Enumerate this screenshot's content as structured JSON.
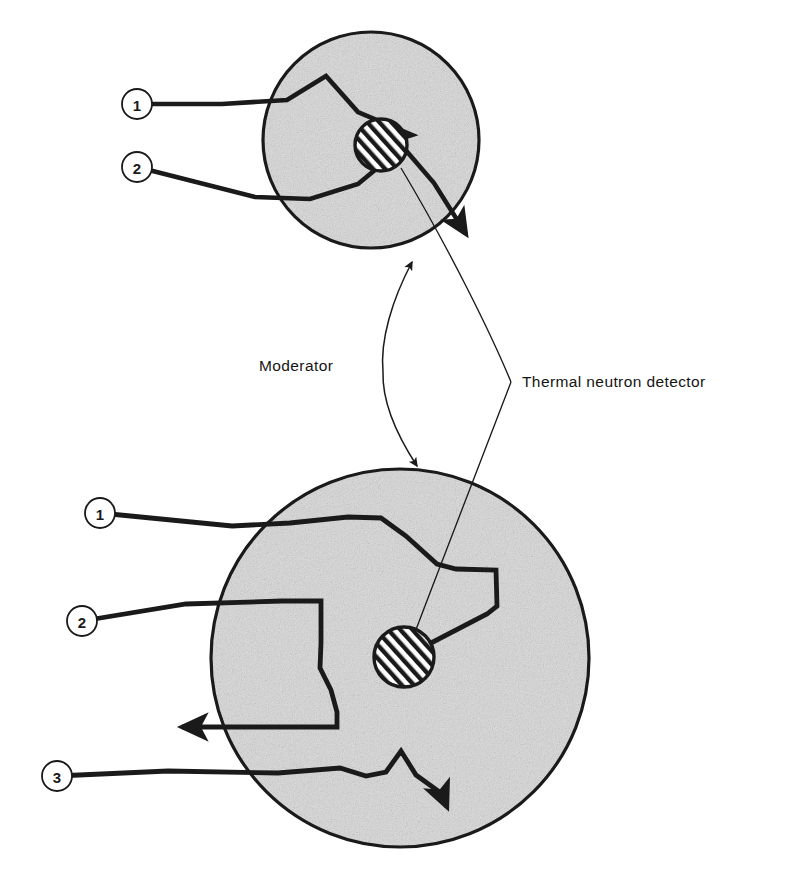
{
  "figure": {
    "background_color": "#ffffff",
    "ink_color": "#1a1a1a",
    "moderator_fill": "#d9d9d9",
    "detector_fill": "#ffffff",
    "detector_hatch_color": "#1a1a1a"
  },
  "annotations": {
    "moderator_label": "Moderator",
    "detector_label": "Thermal neutron detector"
  },
  "callouts": {
    "top": [
      {
        "id": "top-1",
        "number": "1",
        "cx": 137,
        "cy": 104
      },
      {
        "id": "top-2",
        "number": "2",
        "cx": 137,
        "cy": 167
      }
    ],
    "bottom": [
      {
        "id": "bottom-1",
        "number": "1",
        "cx": 100,
        "cy": 513
      },
      {
        "id": "bottom-2",
        "number": "2",
        "cx": 82,
        "cy": 621
      },
      {
        "id": "bottom-3",
        "number": "3",
        "cx": 57,
        "cy": 776
      }
    ],
    "radius": 15
  },
  "moderators": [
    {
      "id": "small-moderator",
      "cx": 371,
      "cy": 140,
      "r": 108
    },
    {
      "id": "large-moderator",
      "cx": 400,
      "cy": 658,
      "r": 189
    }
  ],
  "detectors": [
    {
      "id": "small-detector",
      "cx": 381,
      "cy": 145,
      "r": 26
    },
    {
      "id": "large-detector",
      "cx": 404,
      "cy": 657,
      "r": 30
    }
  ],
  "neutron_tracks": {
    "small_circle": [
      {
        "id": "small-track-1",
        "callout": "1",
        "points": "137,104 222,104 287,100 326,76 358,112 412,135 381,145",
        "terminates_at": "detector"
      },
      {
        "id": "small-track-2",
        "callout": "2",
        "points": "137,167 255,197 310,199 358,184 403,147 434,183 471,239",
        "terminates_at": "escape-arrow"
      }
    ],
    "large_circle": [
      {
        "id": "large-track-1",
        "callout": "1",
        "points": "100,513 232,526 278,524 340,518 380,517 404,535 436,563 455,569 495,569 497,604 488,613 404,657",
        "terminates_at": "detector"
      },
      {
        "id": "large-track-2",
        "callout": "2",
        "points": "82,621 182,604 280,601 300,600 321,601 321,640 320,667 330,688 336,711 337,727 178,727",
        "terminates_at": "escape-arrow"
      },
      {
        "id": "large-track-3",
        "callout": "3",
        "points": "57,776 165,771 275,773 338,768 365,775 385,772 401,751 415,774 441,792 449,812",
        "terminates_at": "escape-arrow"
      }
    ]
  },
  "leader_braces": {
    "moderator": {
      "tip_x": 383,
      "tip_y": 372,
      "upper_target_x": 412,
      "upper_target_y": 258,
      "lower_target_x": 417,
      "lower_target_y": 470
    },
    "detector": {
      "tip_x": 511,
      "tip_y": 382,
      "upper_target_x": 400,
      "upper_target_y": 162,
      "lower_target_x": 407,
      "lower_target_y": 650
    }
  }
}
